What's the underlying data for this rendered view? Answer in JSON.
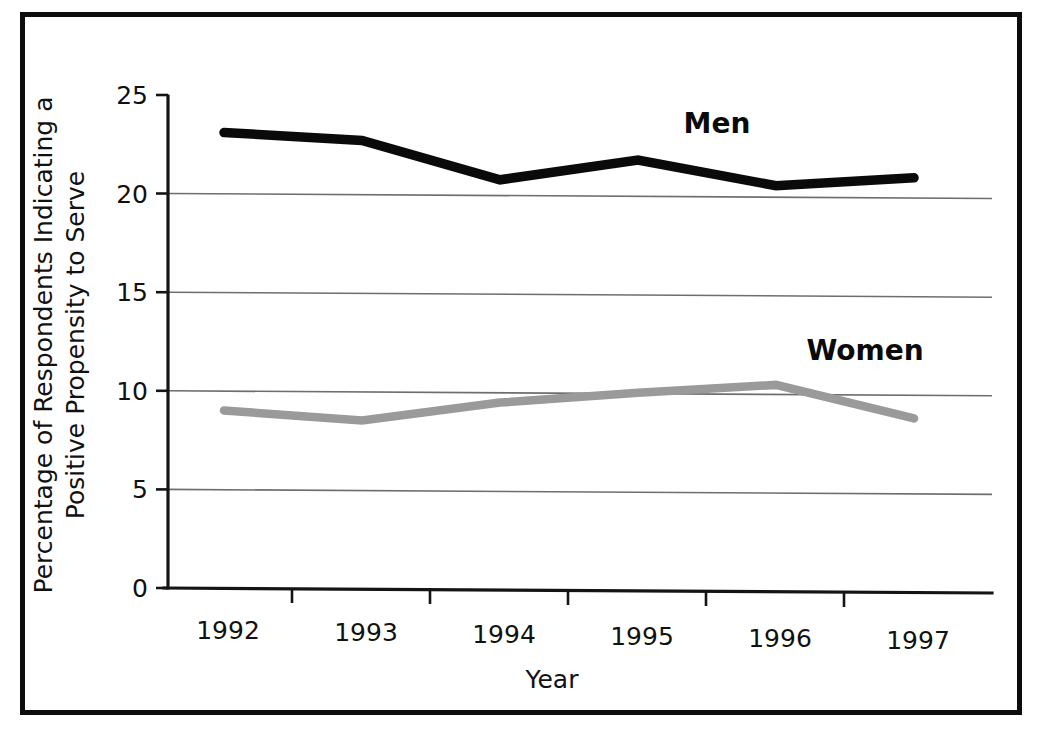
{
  "chart_data": {
    "type": "line",
    "title": "",
    "subtitle": "",
    "xlabel": "Year",
    "ylabel_line1": "Percentage of Respondents Indicating a",
    "ylabel_line2": "Positive Propensity to Serve",
    "categories": [
      "1992",
      "1993",
      "1994",
      "1995",
      "1996",
      "1997"
    ],
    "x_tick_labels": [
      "1992",
      "1993",
      "1994",
      "1995",
      "1996",
      "1997"
    ],
    "y_tick_labels": [
      "0",
      "5",
      "10",
      "15",
      "20",
      "25"
    ],
    "y_ticks": [
      0,
      5,
      10,
      15,
      20,
      25
    ],
    "ylim": [
      0,
      25
    ],
    "grid": true,
    "grid_axis": "y",
    "legend_position": "inline-annotation",
    "series": [
      {
        "name": "Men",
        "label": "Men",
        "color": "#0a0a0a",
        "values": [
          23.1,
          22.7,
          20.7,
          21.7,
          20.4,
          20.8
        ]
      },
      {
        "name": "Women",
        "label": "Women",
        "color": "#9a9a9a",
        "values": [
          9.0,
          8.5,
          9.4,
          9.9,
          10.3,
          8.6
        ]
      }
    ],
    "annotations": [
      {
        "text": "Men",
        "series": "Men"
      },
      {
        "text": "Women",
        "series": "Women"
      }
    ]
  },
  "colors": {
    "frame": "#0d0d0d",
    "background": "#ffffff",
    "men_series": "#0a0a0a",
    "women_series": "#9a9a9a",
    "gridline": "#6e6e6e",
    "axis": "#141414",
    "text": "#111111"
  }
}
